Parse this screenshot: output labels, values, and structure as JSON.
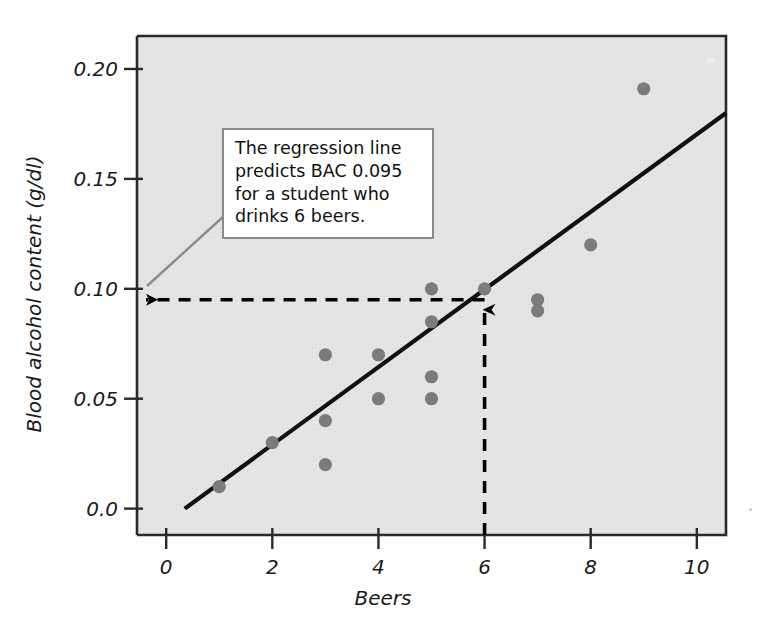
{
  "chart_data": {
    "type": "scatter",
    "title": "",
    "xlabel": "Beers",
    "ylabel": "Blood alcohol content (g/dl)",
    "xlim": [
      -0.55,
      10.55
    ],
    "ylim": [
      -0.012,
      0.215
    ],
    "xticks": [
      0,
      2,
      4,
      6,
      8,
      10
    ],
    "xtick_labels": [
      "0",
      "2",
      "4",
      "6",
      "8",
      "10"
    ],
    "yticks": [
      0.0,
      0.05,
      0.1,
      0.15,
      0.2
    ],
    "ytick_labels": [
      "0.0",
      "0.05",
      "0.10",
      "0.15",
      "0.20"
    ],
    "grid": false,
    "legend": "none",
    "plot_background": "#e3e3e3",
    "point_color": "#7b7b7b",
    "line_color": "#111111",
    "points": [
      {
        "x": 1,
        "y": 0.01
      },
      {
        "x": 2,
        "y": 0.03
      },
      {
        "x": 3,
        "y": 0.02
      },
      {
        "x": 3,
        "y": 0.04
      },
      {
        "x": 3,
        "y": 0.07
      },
      {
        "x": 4,
        "y": 0.05
      },
      {
        "x": 4,
        "y": 0.07
      },
      {
        "x": 5,
        "y": 0.05
      },
      {
        "x": 5,
        "y": 0.06
      },
      {
        "x": 5,
        "y": 0.085
      },
      {
        "x": 5,
        "y": 0.1
      },
      {
        "x": 6,
        "y": 0.1
      },
      {
        "x": 7,
        "y": 0.09
      },
      {
        "x": 7,
        "y": 0.095
      },
      {
        "x": 8,
        "y": 0.12
      },
      {
        "x": 9,
        "y": 0.191
      }
    ],
    "regression_line": {
      "x_start": 0.35,
      "y_start": 0.0,
      "x_end": 10.55,
      "y_end": 0.18
    },
    "prediction": {
      "x": 6,
      "y": 0.095,
      "vertical_guide": true,
      "horizontal_guide": true
    }
  },
  "annotation": {
    "lines": [
      "The regression line",
      "predicts BAC 0.095",
      "for a student who",
      "drinks 6 beers."
    ]
  },
  "axes": {
    "x_title": "Beers",
    "y_title": "Blood alcohol content (g/dl)"
  }
}
